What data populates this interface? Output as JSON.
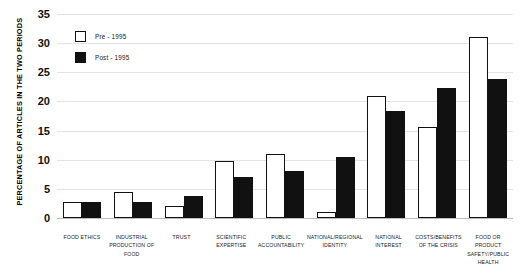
{
  "chart_data": {
    "type": "bar",
    "title": "",
    "subtitle": "",
    "xlabel": "",
    "ylabel": "PERCENTAGE OF ARTICLES IN THE TWO PERIODS",
    "ylim": [
      0,
      35
    ],
    "ytick_labels": [
      "35",
      "30",
      "25",
      "20",
      "15",
      "10",
      "5",
      "0"
    ],
    "ytick_values": [
      35,
      30,
      25,
      20,
      15,
      10,
      5,
      0
    ],
    "grid": true,
    "legend_position": "top-left",
    "categories": [
      "FOOD ETHICS",
      "INDUSTRIAL PRODUCTION OF FOOD",
      "TRUST",
      "SCIENTIFIC EXPERTISE",
      "PUBLIC ACCOUNTABILITY",
      "NATIONAL/REGIONAL IDENTITY",
      "NATIONAL INTEREST",
      "COSTS/BENEFITS OF THE CRISIS",
      "FOOD OR PRODUCT SAFETY/PUBLIC HEALTH"
    ],
    "series": [
      {
        "name": "Pre - 1995",
        "color": "#ffffff",
        "values": [
          2.7,
          4.4,
          2.0,
          9.8,
          11.0,
          1.0,
          21.0,
          15.7,
          31.0
        ]
      },
      {
        "name": "Post - 1995",
        "color": "#111111",
        "values": [
          2.8,
          2.8,
          3.7,
          7.0,
          8.0,
          10.5,
          18.3,
          22.3,
          23.8
        ]
      }
    ]
  },
  "legend": {
    "items": [
      {
        "label": "Pre - 1995",
        "swatch": "hollow-square"
      },
      {
        "label": "Post - 1995",
        "swatch": "filled-square"
      }
    ]
  }
}
